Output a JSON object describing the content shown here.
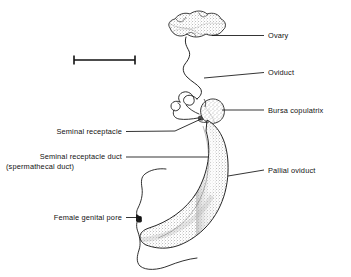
{
  "figure": {
    "kind": "anatomical-line-drawing",
    "background_color": "#ffffff",
    "ink_color": "#111111",
    "stipple_color": "#6b6b6b"
  },
  "scale_bar": {
    "name": "scale-bar",
    "has_caption": false,
    "x_start": 73,
    "x_end": 136,
    "y": 60
  },
  "labels": [
    {
      "id": "ovary",
      "text": "Ovary",
      "side": "right",
      "text_x": 268,
      "text_y": 31,
      "leader": {
        "x1": 212,
        "y1": 35.5,
        "x2": 264,
        "y2": 35.5
      }
    },
    {
      "id": "oviduct",
      "text": "Oviduct",
      "side": "right",
      "text_x": 268,
      "text_y": 68,
      "leader": {
        "x1": 204,
        "y1": 78,
        "x2": 264,
        "y2": 72.5
      }
    },
    {
      "id": "bursa-copulatrix",
      "text": "Bursa copulatrix",
      "side": "right",
      "text_x": 268,
      "text_y": 106,
      "leader": {
        "x1": 222,
        "y1": 110,
        "x2": 264,
        "y2": 110
      }
    },
    {
      "id": "pallial-oviduct",
      "text": "Pallial oviduct",
      "side": "right",
      "text_x": 268,
      "text_y": 166,
      "leader": {
        "x1": 228,
        "y1": 176,
        "x2": 264,
        "y2": 170
      }
    },
    {
      "id": "seminal-receptacle",
      "text": "Seminal receptacle",
      "side": "left",
      "text_x": 122,
      "text_y": 127,
      "leader_path": "M126,131.5 L175,131 L201,119"
    },
    {
      "id": "seminal-receptacle-duct",
      "text": "Seminal receptacle duct",
      "text_line2": "(spermathecal duct)",
      "side": "left",
      "text_x": 122,
      "text_y": 152,
      "leader": {
        "x1": 126,
        "y1": 157,
        "x2": 209,
        "y2": 157
      }
    },
    {
      "id": "female-genital-pore",
      "text": "Female genital pore",
      "side": "left",
      "text_x": 122,
      "text_y": 213,
      "leader": {
        "x1": 126,
        "y1": 217.5,
        "x2": 141,
        "y2": 217.5
      }
    }
  ],
  "structures": [
    {
      "id": "ovary-mass",
      "name": "ovary-shape",
      "description": "irregular lobed stippled mass, upper centre"
    },
    {
      "id": "oviduct-tube",
      "name": "oviduct-shape",
      "description": "thin wavy descending duct from ovary"
    },
    {
      "id": "seminal-receptacle-coils",
      "name": "seminal-receptacle-shape",
      "description": "small convoluted loops left of bursa"
    },
    {
      "id": "bursa-sac",
      "name": "bursa-copulatrix-shape",
      "description": "pear-shaped stippled sac at top of pallial oviduct"
    },
    {
      "id": "pallial-tube",
      "name": "pallial-oviduct-shape",
      "description": "large crescent stippled tube curving down and left"
    },
    {
      "id": "genital-pore-point",
      "name": "female-genital-pore-shape",
      "description": "dark opening at left tip of pallial oviduct"
    },
    {
      "id": "mantle-edge",
      "name": "mantle-body-wall-outline",
      "description": "irregular wavy outline at left of pore"
    }
  ]
}
